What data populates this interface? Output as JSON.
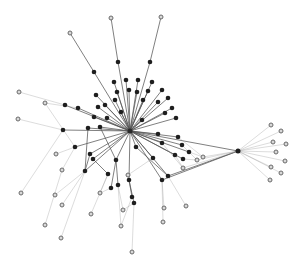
{
  "diagram": {
    "type": "network-graph",
    "width": 301,
    "height": 267,
    "colors": {
      "background": "#ffffff",
      "edge": "#555555",
      "dark_node": "#1e1e1e",
      "leaf_fill": "#d8d8d8",
      "leaf_stroke": "#6a6a6a"
    },
    "nodes": [
      {
        "id": "hub",
        "x": 130,
        "y": 131,
        "kind": "hub",
        "r": 2.5
      },
      {
        "id": "hub2",
        "x": 238,
        "y": 151,
        "kind": "dark",
        "r": 2.5
      },
      {
        "id": "n1",
        "x": 161,
        "y": 17,
        "kind": "leaf"
      },
      {
        "id": "n2",
        "x": 150,
        "y": 62,
        "kind": "dark"
      },
      {
        "id": "n3",
        "x": 111,
        "y": 18,
        "kind": "leaf"
      },
      {
        "id": "n4",
        "x": 118,
        "y": 62,
        "kind": "dark"
      },
      {
        "id": "n5",
        "x": 70,
        "y": 33,
        "kind": "leaf"
      },
      {
        "id": "n6",
        "x": 94,
        "y": 72,
        "kind": "dark"
      },
      {
        "id": "n7",
        "x": 105,
        "y": 105,
        "kind": "dark"
      },
      {
        "id": "n8",
        "x": 114,
        "y": 82,
        "kind": "dark"
      },
      {
        "id": "n9",
        "x": 126,
        "y": 80,
        "kind": "dark"
      },
      {
        "id": "n10",
        "x": 138,
        "y": 80,
        "kind": "dark"
      },
      {
        "id": "n11",
        "x": 152,
        "y": 82,
        "kind": "dark"
      },
      {
        "id": "n12",
        "x": 162,
        "y": 90,
        "kind": "dark"
      },
      {
        "id": "n13",
        "x": 168,
        "y": 98,
        "kind": "dark"
      },
      {
        "id": "n14",
        "x": 172,
        "y": 108,
        "kind": "dark"
      },
      {
        "id": "n15",
        "x": 176,
        "y": 118,
        "kind": "dark"
      },
      {
        "id": "n16",
        "x": 165,
        "y": 113,
        "kind": "dark"
      },
      {
        "id": "n17",
        "x": 158,
        "y": 102,
        "kind": "dark"
      },
      {
        "id": "n18",
        "x": 148,
        "y": 91,
        "kind": "dark"
      },
      {
        "id": "n19",
        "x": 137,
        "y": 92,
        "kind": "dark"
      },
      {
        "id": "n20",
        "x": 129,
        "y": 90,
        "kind": "dark"
      },
      {
        "id": "n21",
        "x": 117,
        "y": 92,
        "kind": "dark"
      },
      {
        "id": "n22",
        "x": 96,
        "y": 95,
        "kind": "dark"
      },
      {
        "id": "n23",
        "x": 115,
        "y": 100,
        "kind": "dark"
      },
      {
        "id": "n24",
        "x": 143,
        "y": 100,
        "kind": "dark"
      },
      {
        "id": "n25",
        "x": 121,
        "y": 112,
        "kind": "dark"
      },
      {
        "id": "n26",
        "x": 142,
        "y": 120,
        "kind": "dark"
      },
      {
        "id": "n27",
        "x": 107,
        "y": 118,
        "kind": "dark"
      },
      {
        "id": "n28",
        "x": 98,
        "y": 107,
        "kind": "dark"
      },
      {
        "id": "n29",
        "x": 94,
        "y": 117,
        "kind": "dark"
      },
      {
        "id": "n30",
        "x": 19,
        "y": 92,
        "kind": "leaf"
      },
      {
        "id": "n31",
        "x": 65,
        "y": 105,
        "kind": "dark"
      },
      {
        "id": "n32",
        "x": 78,
        "y": 108,
        "kind": "dark"
      },
      {
        "id": "n33",
        "x": 45,
        "y": 103,
        "kind": "leaf"
      },
      {
        "id": "n34",
        "x": 18,
        "y": 119,
        "kind": "leaf"
      },
      {
        "id": "n35",
        "x": 63,
        "y": 130,
        "kind": "dark"
      },
      {
        "id": "n36",
        "x": 88,
        "y": 128,
        "kind": "dark"
      },
      {
        "id": "n37",
        "x": 100,
        "y": 127,
        "kind": "dark"
      },
      {
        "id": "n38",
        "x": 56,
        "y": 154,
        "kind": "leaf"
      },
      {
        "id": "n39",
        "x": 90,
        "y": 154,
        "kind": "dark"
      },
      {
        "id": "n40",
        "x": 93,
        "y": 159,
        "kind": "dark"
      },
      {
        "id": "n41",
        "x": 116,
        "y": 160,
        "kind": "dark"
      },
      {
        "id": "n42",
        "x": 136,
        "y": 147,
        "kind": "dark"
      },
      {
        "id": "n43",
        "x": 153,
        "y": 158,
        "kind": "dark"
      },
      {
        "id": "n44",
        "x": 162,
        "y": 143,
        "kind": "dark"
      },
      {
        "id": "n45",
        "x": 175,
        "y": 155,
        "kind": "dark"
      },
      {
        "id": "n46",
        "x": 182,
        "y": 145,
        "kind": "dark"
      },
      {
        "id": "n47",
        "x": 189,
        "y": 152,
        "kind": "dark"
      },
      {
        "id": "n48",
        "x": 183,
        "y": 159,
        "kind": "dark"
      },
      {
        "id": "n49",
        "x": 178,
        "y": 137,
        "kind": "dark"
      },
      {
        "id": "n50",
        "x": 158,
        "y": 134,
        "kind": "dark"
      },
      {
        "id": "n51",
        "x": 62,
        "y": 170,
        "kind": "leaf"
      },
      {
        "id": "n52",
        "x": 75,
        "y": 147,
        "kind": "dark"
      },
      {
        "id": "n53",
        "x": 85,
        "y": 171,
        "kind": "dark"
      },
      {
        "id": "n54",
        "x": 108,
        "y": 174,
        "kind": "dark"
      },
      {
        "id": "n55",
        "x": 111,
        "y": 188,
        "kind": "dark"
      },
      {
        "id": "n56",
        "x": 118,
        "y": 185,
        "kind": "dark"
      },
      {
        "id": "n57",
        "x": 128,
        "y": 175,
        "kind": "leaf"
      },
      {
        "id": "n58",
        "x": 129,
        "y": 180,
        "kind": "dark"
      },
      {
        "id": "n59",
        "x": 132,
        "y": 197,
        "kind": "dark"
      },
      {
        "id": "n60",
        "x": 134,
        "y": 203,
        "kind": "dark"
      },
      {
        "id": "n61",
        "x": 162,
        "y": 180,
        "kind": "dark"
      },
      {
        "id": "n62",
        "x": 168,
        "y": 176,
        "kind": "dark"
      },
      {
        "id": "n63",
        "x": 183,
        "y": 168,
        "kind": "leaf"
      },
      {
        "id": "n64",
        "x": 197,
        "y": 160,
        "kind": "leaf"
      },
      {
        "id": "n65",
        "x": 203,
        "y": 157,
        "kind": "leaf"
      },
      {
        "id": "n66",
        "x": 21,
        "y": 193,
        "kind": "leaf"
      },
      {
        "id": "n67",
        "x": 55,
        "y": 195,
        "kind": "leaf"
      },
      {
        "id": "n68",
        "x": 62,
        "y": 205,
        "kind": "leaf"
      },
      {
        "id": "n69",
        "x": 100,
        "y": 193,
        "kind": "leaf"
      },
      {
        "id": "n70",
        "x": 91,
        "y": 214,
        "kind": "leaf"
      },
      {
        "id": "n71",
        "x": 123,
        "y": 210,
        "kind": "leaf"
      },
      {
        "id": "n72",
        "x": 164,
        "y": 208,
        "kind": "leaf"
      },
      {
        "id": "n73",
        "x": 186,
        "y": 206,
        "kind": "leaf"
      },
      {
        "id": "n74",
        "x": 163,
        "y": 222,
        "kind": "leaf"
      },
      {
        "id": "n75",
        "x": 121,
        "y": 226,
        "kind": "leaf"
      },
      {
        "id": "n76",
        "x": 45,
        "y": 225,
        "kind": "leaf"
      },
      {
        "id": "n77",
        "x": 61,
        "y": 238,
        "kind": "leaf"
      },
      {
        "id": "n78",
        "x": 132,
        "y": 252,
        "kind": "leaf"
      },
      {
        "id": "n79",
        "x": 271,
        "y": 125,
        "kind": "leaf"
      },
      {
        "id": "n80",
        "x": 281,
        "y": 131,
        "kind": "leaf"
      },
      {
        "id": "n81",
        "x": 273,
        "y": 142,
        "kind": "leaf"
      },
      {
        "id": "n82",
        "x": 286,
        "y": 144,
        "kind": "leaf"
      },
      {
        "id": "n83",
        "x": 276,
        "y": 152,
        "kind": "leaf"
      },
      {
        "id": "n84",
        "x": 285,
        "y": 161,
        "kind": "leaf"
      },
      {
        "id": "n85",
        "x": 271,
        "y": 167,
        "kind": "leaf"
      },
      {
        "id": "n86",
        "x": 281,
        "y": 173,
        "kind": "leaf"
      },
      {
        "id": "n87",
        "x": 270,
        "y": 180,
        "kind": "leaf"
      }
    ],
    "edges": [
      [
        "hub",
        "n2"
      ],
      [
        "n2",
        "n1"
      ],
      [
        "hub",
        "n4"
      ],
      [
        "n4",
        "n3"
      ],
      [
        "hub",
        "n6"
      ],
      [
        "n6",
        "n5"
      ],
      [
        "hub",
        "n7"
      ],
      [
        "hub",
        "n8"
      ],
      [
        "hub",
        "n9"
      ],
      [
        "hub",
        "n10"
      ],
      [
        "hub",
        "n11"
      ],
      [
        "hub",
        "n12"
      ],
      [
        "hub",
        "n13"
      ],
      [
        "hub",
        "n14"
      ],
      [
        "hub",
        "n15"
      ],
      [
        "hub",
        "n16"
      ],
      [
        "hub",
        "n17"
      ],
      [
        "hub",
        "n18"
      ],
      [
        "hub",
        "n19"
      ],
      [
        "hub",
        "n20"
      ],
      [
        "hub",
        "n21"
      ],
      [
        "hub",
        "n22"
      ],
      [
        "hub",
        "n23"
      ],
      [
        "hub",
        "n24"
      ],
      [
        "hub",
        "n25"
      ],
      [
        "hub",
        "n26"
      ],
      [
        "hub",
        "n27"
      ],
      [
        "hub",
        "n28"
      ],
      [
        "hub",
        "n29"
      ],
      [
        "hub",
        "n31"
      ],
      [
        "n31",
        "n30"
      ],
      [
        "hub",
        "n32"
      ],
      [
        "n32",
        "n33"
      ],
      [
        "hub",
        "n35"
      ],
      [
        "n35",
        "n34"
      ],
      [
        "hub",
        "n36"
      ],
      [
        "hub",
        "n37"
      ],
      [
        "hub",
        "n39"
      ],
      [
        "hub",
        "n40"
      ],
      [
        "hub",
        "n41"
      ],
      [
        "hub",
        "n42"
      ],
      [
        "hub",
        "n43"
      ],
      [
        "hub",
        "n44"
      ],
      [
        "hub",
        "n45"
      ],
      [
        "hub",
        "n46"
      ],
      [
        "hub",
        "n47"
      ],
      [
        "hub",
        "n48"
      ],
      [
        "hub",
        "n49"
      ],
      [
        "hub",
        "n50"
      ],
      [
        "hub",
        "hub2"
      ],
      [
        "hub",
        "n58"
      ],
      [
        "hub",
        "n61"
      ],
      [
        "hub",
        "n62"
      ],
      [
        "hub",
        "n53"
      ],
      [
        "hub",
        "n52"
      ],
      [
        "n52",
        "n38"
      ],
      [
        "n52",
        "n51"
      ],
      [
        "n33",
        "n52"
      ],
      [
        "n39",
        "n53"
      ],
      [
        "n40",
        "n54"
      ],
      [
        "n53",
        "n67"
      ],
      [
        "n53",
        "n68"
      ],
      [
        "n54",
        "n69"
      ],
      [
        "n54",
        "n70"
      ],
      [
        "n41",
        "n55"
      ],
      [
        "n55",
        "n69"
      ],
      [
        "n41",
        "n56"
      ],
      [
        "n56",
        "n71"
      ],
      [
        "n43",
        "n57"
      ],
      [
        "n57",
        "n58"
      ],
      [
        "n58",
        "n59"
      ],
      [
        "n58",
        "n60"
      ],
      [
        "n59",
        "n75"
      ],
      [
        "n60",
        "n78"
      ],
      [
        "n61",
        "n72"
      ],
      [
        "n62",
        "n73"
      ],
      [
        "n61",
        "n74"
      ],
      [
        "n45",
        "n63"
      ],
      [
        "n46",
        "n64"
      ],
      [
        "n47",
        "n65"
      ],
      [
        "n48",
        "n64"
      ],
      [
        "n44",
        "n63"
      ],
      [
        "n49",
        "n65"
      ],
      [
        "n42",
        "n62"
      ],
      [
        "n36",
        "n53"
      ],
      [
        "n37",
        "n41"
      ],
      [
        "n35",
        "n66"
      ],
      [
        "n51",
        "n76"
      ],
      [
        "n53",
        "n77"
      ],
      [
        "n56",
        "n75"
      ],
      [
        "n60",
        "n71"
      ],
      [
        "hub2",
        "n61"
      ],
      [
        "hub2",
        "n62"
      ],
      [
        "hub2",
        "n63"
      ],
      [
        "hub2",
        "n64"
      ],
      [
        "hub2",
        "n65"
      ],
      [
        "hub2",
        "n79"
      ],
      [
        "hub2",
        "n80"
      ],
      [
        "hub2",
        "n81"
      ],
      [
        "hub2",
        "n82"
      ],
      [
        "hub2",
        "n83"
      ],
      [
        "hub2",
        "n84"
      ],
      [
        "hub2",
        "n85"
      ],
      [
        "hub2",
        "n86"
      ],
      [
        "hub2",
        "n87"
      ]
    ]
  }
}
